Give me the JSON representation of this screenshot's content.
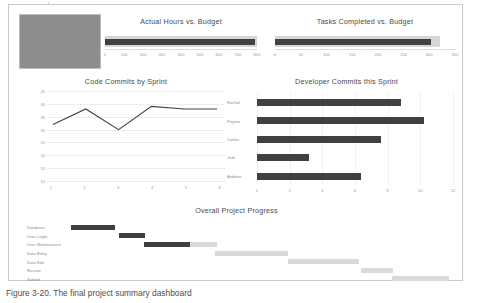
{
  "page": {
    "caption": "Figure 3-20. The final project summary dashboard"
  },
  "image_placeholder": {
    "name": "dashboard-thumbnail"
  },
  "chart_data": [
    {
      "id": "actual-hours",
      "type": "bar",
      "title": "Actual Hours vs. Budget",
      "orientation": "horizontal",
      "xlabel": "",
      "ylabel": "",
      "xlim": [
        0,
        800
      ],
      "xticks": [
        0,
        100,
        200,
        300,
        400,
        500,
        600,
        700,
        800
      ],
      "grid": false,
      "categories": [
        "Hours"
      ],
      "series": [
        {
          "name": "Budget",
          "values": [
            700
          ]
        },
        {
          "name": "Actual",
          "values": [
            690
          ]
        }
      ]
    },
    {
      "id": "tasks-completed",
      "type": "bar",
      "title": "Tasks Completed vs. Budget",
      "orientation": "horizontal",
      "xlabel": "",
      "ylabel": "",
      "xlim": [
        0,
        350
      ],
      "xticks": [
        0,
        50,
        100,
        150,
        200,
        250,
        300,
        350
      ],
      "grid": false,
      "categories": [
        "Tasks"
      ],
      "series": [
        {
          "name": "Budget",
          "values": [
            320
          ]
        },
        {
          "name": "Actual",
          "values": [
            303
          ]
        }
      ]
    },
    {
      "id": "code-commits",
      "type": "line",
      "title": "Code Commits by Sprint",
      "xlabel": "",
      "ylabel": "",
      "categories": [
        "1",
        "2",
        "3",
        "4",
        "5",
        "6"
      ],
      "xticks": [
        "1",
        "2",
        "3",
        "4",
        "5",
        "6"
      ],
      "yticks": [
        10,
        15,
        20,
        25,
        30,
        35,
        40,
        45
      ],
      "ylim": [
        10,
        45
      ],
      "grid": true,
      "series": [
        {
          "name": "Commits",
          "values": [
            32,
            38,
            30,
            39,
            38,
            38
          ]
        }
      ]
    },
    {
      "id": "developer-commits",
      "type": "bar",
      "title": "Developer Commits this Sprint",
      "orientation": "horizontal",
      "xlabel": "",
      "ylabel": "",
      "xlim": [
        0,
        12
      ],
      "xticks": [
        0,
        2,
        4,
        6,
        8,
        10,
        12
      ],
      "grid": true,
      "categories": [
        "Rachel",
        "Peyton",
        "Carlos",
        "Jodi",
        "Andrew"
      ],
      "values": [
        8.8,
        10.2,
        7.6,
        3.2,
        6.4
      ]
    },
    {
      "id": "overall-project-progress",
      "type": "bar",
      "title": "Overall Project Progress",
      "orientation": "horizontal",
      "xlabel": "",
      "ylabel": "",
      "grid": false,
      "categories": [
        "Database",
        "User Login",
        "User Maintenance",
        "Data Entry",
        "Data Edit",
        "Review",
        "Submit"
      ],
      "tasks": [
        {
          "label": "Database",
          "start": 0,
          "length": 45,
          "percent_complete": 100
        },
        {
          "label": "User Login",
          "start": 49,
          "length": 26,
          "percent_complete": 100
        },
        {
          "label": "User Maintenance",
          "start": 74,
          "length": 74,
          "percent_complete": 64
        },
        {
          "label": "Data Entry",
          "start": 146,
          "length": 74,
          "percent_complete": 0
        },
        {
          "label": "Data Edit",
          "start": 220,
          "length": 72,
          "percent_complete": 0
        },
        {
          "label": "Review",
          "start": 295,
          "length": 32,
          "percent_complete": 0
        },
        {
          "label": "Submit",
          "start": 326,
          "length": 58,
          "percent_complete": 0
        }
      ]
    }
  ],
  "colors": {
    "bar_dark": "#404040",
    "bar_light": "#d6d6d6",
    "line": "#404040",
    "grid": "#ededed",
    "text": "#8d8d8d",
    "title": "#4a4a4a",
    "page_border": "#c9c9c9",
    "placeholder": "#8e8e8e"
  }
}
